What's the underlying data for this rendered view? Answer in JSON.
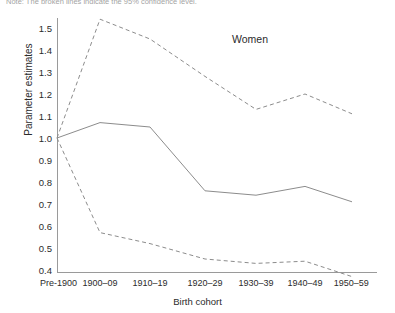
{
  "caption": {
    "text": "Note: The broken lines indicate the 95% confidence level."
  },
  "annotation": {
    "women_label": "Women"
  },
  "axes": {
    "ylabel": "Parameter estimates",
    "xlabel": "Birth cohort",
    "ytick_labels": [
      "1.5",
      "1.4",
      "1.3",
      "1.2",
      "1.1",
      "1.0",
      "0.9",
      "0.8",
      "0.7",
      "0.6",
      "0.5",
      "0.4"
    ],
    "xtick_labels": [
      "Pre-1900",
      "1900–09",
      "1910–19",
      "1920–29",
      "1930–39",
      "1940–49",
      "1950–59"
    ]
  },
  "colors": {
    "line": "#8c8c8c",
    "axis": "#9a9a9a",
    "text": "#2b2b2b",
    "background": "#ffffff"
  },
  "chart_data": {
    "type": "line",
    "title": "Women",
    "xlabel": "Birth cohort",
    "ylabel": "Parameter estimates",
    "categories": [
      "Pre-1900",
      "1900–09",
      "1910–19",
      "1920–29",
      "1930–39",
      "1940–49",
      "1950–59"
    ],
    "ylim": [
      0.4,
      1.55
    ],
    "yticks": [
      0.4,
      0.5,
      0.6,
      0.7,
      0.8,
      0.9,
      1.0,
      1.1,
      1.2,
      1.3,
      1.4,
      1.5
    ],
    "grid": false,
    "legend_position": "none",
    "series": [
      {
        "name": "Upper 95% confidence limit",
        "style": "dashed",
        "values": [
          1.0,
          1.54,
          1.45,
          1.28,
          1.13,
          1.2,
          1.11
        ]
      },
      {
        "name": "Parameter estimate",
        "style": "solid",
        "values": [
          1.0,
          1.07,
          1.05,
          0.76,
          0.74,
          0.78,
          0.71
        ]
      },
      {
        "name": "Lower 95% confidence limit",
        "style": "dashed",
        "values": [
          1.0,
          0.57,
          0.52,
          0.45,
          0.43,
          0.44,
          0.37
        ]
      }
    ],
    "annotations": [
      {
        "text": "Women",
        "x": "1930–39",
        "y": 1.45
      }
    ]
  }
}
